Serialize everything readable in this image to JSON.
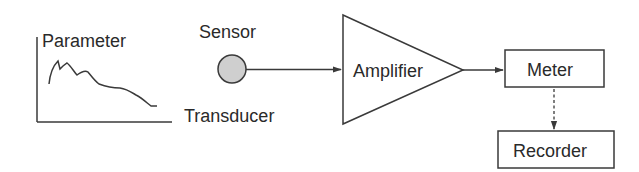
{
  "diagram": {
    "graph_labels": {
      "parameter": "Parameter",
      "transducer": "Transducer"
    },
    "sensor": {
      "label": "Sensor",
      "fill": "#cfcfcf"
    },
    "amplifier": {
      "label": "Amplifier"
    },
    "meter": {
      "label": "Meter"
    },
    "recorder": {
      "label": "Recorder"
    },
    "connections": [
      {
        "from": "Sensor",
        "to": "Amplifier",
        "style": "solid"
      },
      {
        "from": "Amplifier",
        "to": "Meter",
        "style": "solid"
      },
      {
        "from": "Meter",
        "to": "Recorder",
        "style": "dashed"
      }
    ],
    "colors": {
      "line": "#3a3a3a",
      "text": "#2a2a2a",
      "background": "#ffffff"
    }
  }
}
